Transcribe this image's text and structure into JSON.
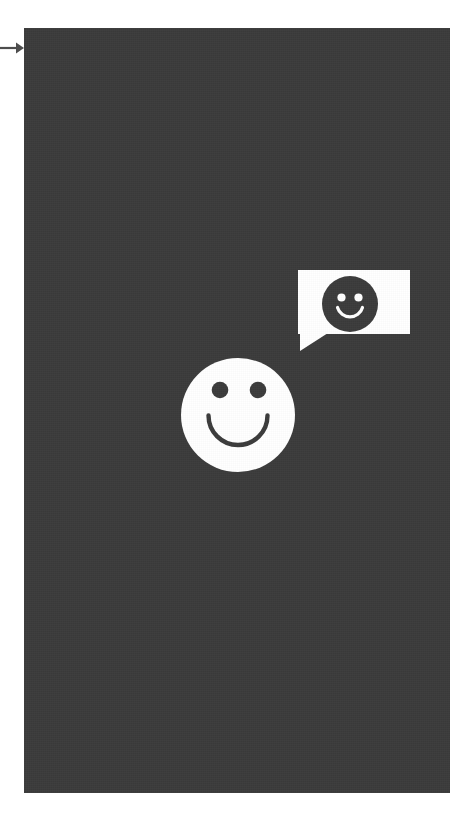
{
  "canvas": {
    "width": 472,
    "height": 820,
    "page_background": "#ffffff"
  },
  "annotation": {
    "pointer": {
      "icon": "arrow-right-icon",
      "label": "",
      "color": "#4d4d4d",
      "x": 0,
      "y": 48,
      "length": 24
    }
  },
  "panel": {
    "name": "chat-panel",
    "background_color": "#3b3b3b",
    "x": 24,
    "y": 28,
    "width": 426,
    "height": 765
  },
  "speech_bubble": {
    "name": "speech-bubble",
    "fill_color": "#ffffff",
    "x": 298,
    "y": 270,
    "width": 112,
    "height": 64,
    "tail": "bottom-left",
    "content_icon": "smiley-face-icon",
    "content_text": "",
    "emoji_color": "#3b3b3b",
    "emoji_feature_color": "#ffffff",
    "emoji_diameter": 56
  },
  "big_smiley": {
    "name": "smiley-face-icon",
    "fill_color": "#ffffff",
    "feature_color": "#3b3b3b",
    "x": 181,
    "y": 358,
    "diameter": 114,
    "eye_radius": 8,
    "mouth": "smile-arc"
  },
  "colors": {
    "panel": "#3b3b3b",
    "white": "#ffffff",
    "arrow": "#4d4d4d"
  }
}
